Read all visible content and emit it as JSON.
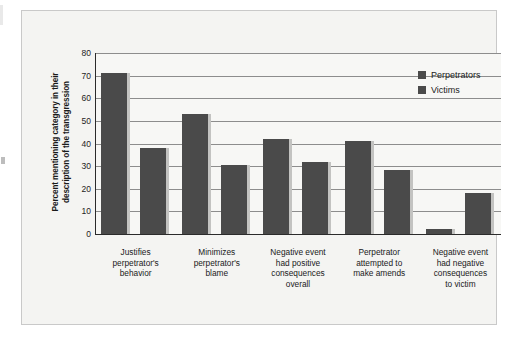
{
  "chart_data": {
    "type": "bar",
    "title": "",
    "xlabel": "",
    "ylabel": "Percent mentioning category in their description of the transgression",
    "ylabel_lines": [
      "Percent mentioning category in their",
      "description of the transgression"
    ],
    "ylim": [
      0,
      80
    ],
    "ytick_step": 10,
    "yticks": [
      0,
      10,
      20,
      30,
      40,
      50,
      60,
      70,
      80
    ],
    "ytick_labels": [
      "0",
      "10",
      "20",
      "30",
      "40",
      "50",
      "60",
      "70",
      "80"
    ],
    "grid": true,
    "grid_axis": "y",
    "legend_position": "top-right",
    "categories": [
      "Justifies perpetrator's behavior",
      "Minimizes perpetrator's blame",
      "Negative event had positive consequences overall",
      "Perpetrator attempted to make amends",
      "Negative event had negative consequences to victim"
    ],
    "category_lines": [
      [
        "Justifies",
        "perpetrator's",
        "behavior"
      ],
      [
        "Minimizes",
        "perpetrator's",
        "blame"
      ],
      [
        "Negative event",
        "had positive",
        "consequences",
        "overall"
      ],
      [
        "Perpetrator",
        "attempted to",
        "make amends"
      ],
      [
        "Negative event",
        "had negative",
        "consequences",
        "to victim"
      ]
    ],
    "series": [
      {
        "name": "Perpetrators",
        "color": "#4a4a4a",
        "values": [
          71,
          53,
          42,
          41,
          2
        ]
      },
      {
        "name": "Victims",
        "color": "#4a4a4a",
        "values": [
          38,
          30.5,
          32,
          28.5,
          18
        ]
      }
    ]
  },
  "legend": {
    "items": [
      {
        "label": "Perpetrators"
      },
      {
        "label": "Victims"
      }
    ]
  },
  "colors": {
    "bar": "#4a4a4a",
    "bar_shadow": "#c3c3c1",
    "plot_background": "#f7f7f5",
    "frame_background": "#f4f4f2",
    "frame_border": "#c9c9c9",
    "gridline": "#8d8d8d",
    "axis": "#2b2b2b",
    "text": "#1a1a1a"
  }
}
